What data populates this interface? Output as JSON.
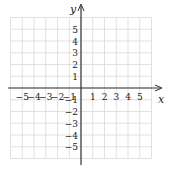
{
  "diagram": {
    "type": "coordinate-plane",
    "x_axis_label": "x",
    "y_axis_label": "y",
    "x_range": [
      -6,
      6
    ],
    "y_range": [
      -6,
      6
    ],
    "x_ticks": [
      {
        "v": -5,
        "label": "−5"
      },
      {
        "v": -4,
        "label": "−4"
      },
      {
        "v": -3,
        "label": "−3"
      },
      {
        "v": -2,
        "label": "−2"
      },
      {
        "v": -1,
        "label": "−1"
      },
      {
        "v": 1,
        "label": "1"
      },
      {
        "v": 2,
        "label": "2"
      },
      {
        "v": 3,
        "label": "3"
      },
      {
        "v": 4,
        "label": "4"
      },
      {
        "v": 5,
        "label": "5"
      }
    ],
    "y_ticks": [
      {
        "v": 5,
        "label": "5"
      },
      {
        "v": 4,
        "label": "4"
      },
      {
        "v": 3,
        "label": "3"
      },
      {
        "v": 2,
        "label": "2"
      },
      {
        "v": 1,
        "label": "1"
      },
      {
        "v": -1,
        "label": "−1"
      },
      {
        "v": -2,
        "label": "−2"
      },
      {
        "v": -3,
        "label": "−3"
      },
      {
        "v": -4,
        "label": "−4"
      },
      {
        "v": -5,
        "label": "−5"
      }
    ],
    "colors": {
      "grid": "#d9d9d9",
      "axis": "#333333",
      "text": "#222222"
    }
  }
}
